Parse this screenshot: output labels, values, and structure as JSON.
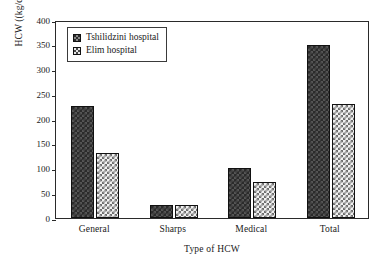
{
  "chart_data": {
    "type": "bar",
    "title": "",
    "subtitle": "",
    "xlabel": "Type of HCW",
    "ylabel": "HCW ((kg/day)",
    "categories": [
      "General",
      "Sharps",
      "Medical",
      "Total"
    ],
    "series": [
      {
        "name": "Tshilidzini hospital",
        "values": [
          226,
          26,
          101,
          350
        ]
      },
      {
        "name": "Elim hospital",
        "values": [
          131,
          26,
          73,
          230
        ]
      }
    ],
    "ylim": [
      0,
      400
    ],
    "yticks": [
      0,
      50,
      100,
      150,
      200,
      250,
      300,
      350,
      400
    ],
    "ytick_labels": [
      "0",
      "50",
      "100",
      "150",
      "200",
      "250",
      "300",
      "350",
      "400"
    ],
    "grid": false,
    "legend_position": "upper left",
    "legend_entries": [
      "Tshilidzini hospital",
      "Elim hospital"
    ],
    "series_colors": [
      "#2b2b2b",
      "#e8e8e8"
    ],
    "axis_color": "#2a2a2a",
    "background": "#ffffff"
  }
}
